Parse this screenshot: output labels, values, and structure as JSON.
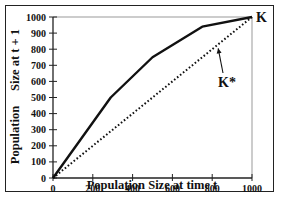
{
  "chart_data": {
    "type": "line",
    "title": "",
    "xlabel": "Population Size at time  t",
    "ylabel": "Population   Size at t + 1",
    "xlim": [
      0,
      1000
    ],
    "ylim": [
      0,
      1000
    ],
    "x_ticks": [
      0,
      200,
      400,
      600,
      800,
      1000
    ],
    "y_ticks": [
      0,
      100,
      200,
      300,
      400,
      500,
      600,
      700,
      800,
      900,
      1000
    ],
    "grid": false,
    "legend": null,
    "series": [
      {
        "name": "recruitment curve",
        "style": "solid",
        "x": [
          0,
          290,
          500,
          750,
          1000
        ],
        "y": [
          0,
          500,
          750,
          940,
          1000
        ]
      },
      {
        "name": "replacement line (1:1)",
        "style": "dotted",
        "x": [
          0,
          1000
        ],
        "y": [
          0,
          1000
        ]
      }
    ],
    "annotations": [
      {
        "text": "K",
        "x": 1000,
        "y": 1000
      },
      {
        "text": "K*",
        "arrow_to": [
          830,
          830
        ]
      }
    ]
  },
  "labels": {
    "x_axis": "Population Size at time  t",
    "y_axis_part1": "Population",
    "y_axis_part2": "Size at t + 1",
    "k": "K",
    "k_star": "K*",
    "x_ticks": [
      "0",
      "200",
      "400",
      "600",
      "800",
      "1000"
    ],
    "y_ticks": [
      "0",
      "100",
      "200",
      "300",
      "400",
      "500",
      "600",
      "700",
      "800",
      "900",
      "1000"
    ]
  }
}
